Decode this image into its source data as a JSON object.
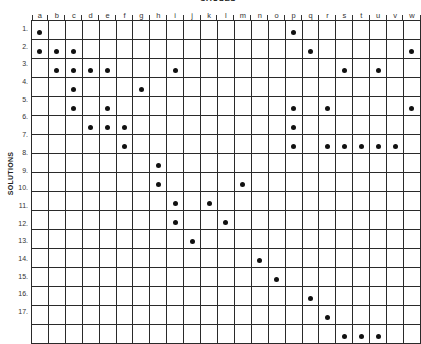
{
  "title": "CAUSES",
  "row_axis_label": "SOLUTIONS",
  "columns": [
    "a",
    "b",
    "c",
    "d",
    "e",
    "f",
    "g",
    "h",
    "i",
    "j",
    "k",
    "l",
    "m",
    "n",
    "o",
    "p",
    "q",
    "r",
    "s",
    "t",
    "u",
    "v",
    "w"
  ],
  "rows": [
    {
      "label": "1.",
      "marks": [
        "a",
        "p"
      ]
    },
    {
      "label": "2.",
      "marks": [
        "a",
        "b",
        "c",
        "q",
        "w"
      ]
    },
    {
      "label": "3.",
      "marks": [
        "b",
        "c",
        "d",
        "e",
        "i",
        "s",
        "u"
      ]
    },
    {
      "label": "4.",
      "marks": [
        "c",
        "g"
      ]
    },
    {
      "label": "5.",
      "marks": [
        "c",
        "e",
        "p",
        "r",
        "w"
      ]
    },
    {
      "label": "6.",
      "marks": [
        "d",
        "e",
        "f",
        "p"
      ]
    },
    {
      "label": "7.",
      "marks": [
        "f",
        "p",
        "r",
        "s",
        "t",
        "u",
        "v"
      ]
    },
    {
      "label": "8.",
      "marks": [
        "h"
      ]
    },
    {
      "label": "9.",
      "marks": [
        "h",
        "m"
      ]
    },
    {
      "label": "10.",
      "marks": [
        "i",
        "k"
      ]
    },
    {
      "label": "11.",
      "marks": [
        "i",
        "l"
      ]
    },
    {
      "label": "12.",
      "marks": [
        "j"
      ]
    },
    {
      "label": "13.",
      "marks": [
        "n"
      ]
    },
    {
      "label": "14.",
      "marks": [
        "o"
      ]
    },
    {
      "label": "15.",
      "marks": [
        "q"
      ]
    },
    {
      "label": "16.",
      "marks": [
        "r"
      ]
    },
    {
      "label": "17.",
      "marks": [
        "s",
        "t",
        "u"
      ]
    }
  ],
  "colors": {
    "grid": "#2a2a2a",
    "dot": "#111111",
    "background": "#ffffff"
  }
}
